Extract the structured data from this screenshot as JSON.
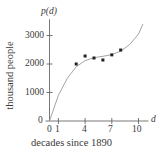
{
  "chart_data": {
    "type": "scatter",
    "title": "",
    "xlabel": "decades since 1890",
    "ylabel": "thousand people",
    "x_axis_var": "d",
    "y_axis_var": "p(d)",
    "x_ticks": [
      0,
      1,
      4,
      7,
      10
    ],
    "y_ticks": [
      0,
      1000,
      2000,
      3000
    ],
    "xlim": [
      0,
      11
    ],
    "ylim": [
      0,
      3500
    ],
    "grid": false,
    "legend": null,
    "series": [
      {
        "name": "data points",
        "kind": "scatter",
        "x": [
          3,
          4,
          5,
          6,
          7,
          8
        ],
        "y": [
          2000,
          2280,
          2210,
          2140,
          2320,
          2490
        ]
      },
      {
        "name": "fitted curve",
        "kind": "line",
        "x": [
          0,
          1,
          2,
          3,
          4,
          5,
          6,
          7,
          8,
          9,
          10,
          10.5
        ],
        "y": [
          0,
          900,
          1500,
          1900,
          2120,
          2220,
          2270,
          2330,
          2450,
          2680,
          3050,
          3400
        ]
      }
    ]
  },
  "labels": {
    "y_var": "p(d)",
    "x_var": "d",
    "ylabel": "thousand people",
    "xlabel": "decades since 1890",
    "y_tick_labels": [
      "0",
      "1000",
      "2000",
      "3000"
    ],
    "x_tick_labels": [
      "0",
      "1",
      "4",
      "7",
      "10"
    ]
  }
}
